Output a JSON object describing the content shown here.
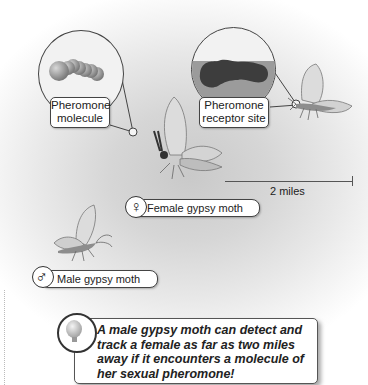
{
  "figure": {
    "labels": {
      "pheromone_molecule_line1": "Pheromone",
      "pheromone_molecule_line2": "molecule",
      "receptor_site_line1": "Pheromone",
      "receptor_site_line2": "receptor site",
      "female": "Female gypsy moth",
      "male": "Male gypsy moth",
      "distance": "2 miles"
    },
    "symbols": {
      "female": "♀",
      "male": "♂"
    },
    "callout": {
      "icon": "lightbulb-icon",
      "text": "A male gypsy moth can detect and track a female as far as two miles away if it encounters a molecule of her sexual pheromone!"
    },
    "colors": {
      "background_center": "#c9c9c9",
      "outline": "#444444",
      "molecule": "#9a9a9a",
      "receptor": "#555555",
      "moth_wing": "#dcdcdc"
    }
  }
}
